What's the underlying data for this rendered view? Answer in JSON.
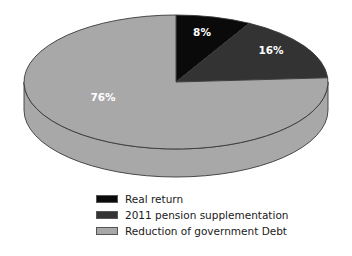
{
  "chart_data": {
    "type": "pie",
    "title": "",
    "subtitle": "",
    "xlabel": "",
    "ylabel": "",
    "grid": false,
    "three_d": true,
    "start_angle_deg": 0,
    "direction": "clockwise",
    "legend_position": "bottom",
    "categories": [
      "Real return",
      "2011 pension supplementation",
      "Reduction of government Debt"
    ],
    "values": [
      8,
      16,
      76
    ],
    "data_labels": [
      "8%",
      "16%",
      "76%"
    ],
    "colors": [
      "#0a0a0a",
      "#333333",
      "#a8a8a8"
    ],
    "outline_color": "#3a3a3a",
    "label_color": "#ffffff",
    "slices": [
      {
        "name": "Real return",
        "value": 8,
        "label": "8%",
        "color": "#0a0a0a",
        "label_x": 202,
        "label_y": 36
      },
      {
        "name": "2011 pension supplementation",
        "value": 16,
        "label": "16%",
        "color": "#333333",
        "label_x": 271,
        "label_y": 54
      },
      {
        "name": "Reduction of government Debt",
        "value": 76,
        "label": "76%",
        "color": "#a8a8a8",
        "label_x": 103,
        "label_y": 101
      }
    ]
  },
  "legend": {
    "items": [
      {
        "label": "Real return",
        "color": "#0a0a0a"
      },
      {
        "label": "2011 pension supplementation",
        "color": "#333333"
      },
      {
        "label": "Reduction of government Debt",
        "color": "#a8a8a8"
      }
    ]
  }
}
